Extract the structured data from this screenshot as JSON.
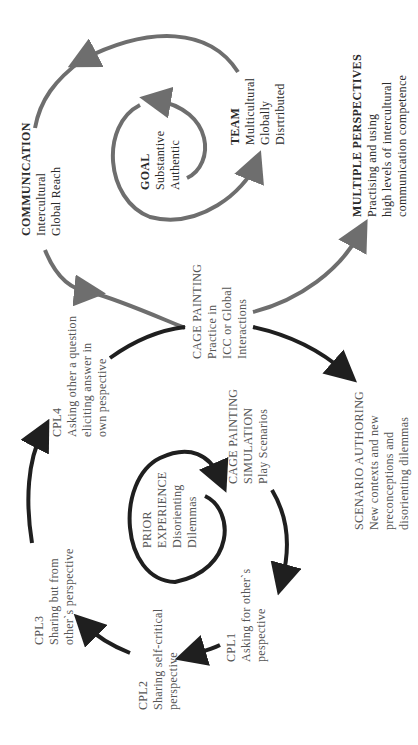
{
  "diagram": {
    "orientation": "rotated -90 degrees (text reads bottom-to-top)",
    "colors": {
      "outer_cycle": "#6e6e6e",
      "inner_cycle": "#1f1f1f",
      "background": "#ffffff",
      "text": "#2a2a2a"
    },
    "nodes": {
      "communication": {
        "title": "COMMUNICATION",
        "lines": [
          "Intercultural",
          "Global Reach"
        ]
      },
      "goal": {
        "title": "GOAL",
        "lines": [
          "Substantive",
          "Authentic"
        ]
      },
      "team": {
        "title": "TEAM",
        "lines": [
          "Multicultural",
          "Globally",
          "Disrtributed"
        ]
      },
      "multiple_perspectives": {
        "title": "MULTIPLE PERSPECTIVES",
        "lines": [
          "Practising and using",
          "high levels of intercultural",
          "communication competence"
        ]
      },
      "cage_painting": {
        "title": "CAGE PAINTING",
        "lines": [
          "Practice in",
          "ICC or Global",
          "Interactions"
        ]
      },
      "cpl4": {
        "title": "CPL4",
        "lines": [
          "Asking other a question",
          "eliciting answer in",
          "own pespective"
        ]
      },
      "cage_painting_simulation": {
        "title_lines": [
          "CAGE PAINTING",
          "SIMULATION"
        ],
        "lines": [
          "Play Scenarios"
        ]
      },
      "scenario_authoring": {
        "title": "SCENARIO AUTHORING",
        "lines": [
          "New contexts and new",
          "preconceptions and",
          "disorienting dilemmas"
        ]
      },
      "prior_experience": {
        "title_lines": [
          "PRIOR",
          "EXPERIENCE"
        ],
        "lines": [
          "Disorienting",
          "Dilemmas"
        ]
      },
      "cpl1": {
        "title": "CPL1",
        "lines": [
          "Asking for other`s",
          "pespective"
        ]
      },
      "cpl2": {
        "title": "CPL2",
        "lines": [
          "Sharing self-critical",
          "perspective"
        ]
      },
      "cpl3": {
        "title": "CPL3",
        "lines": [
          "Sharing but from",
          "other`s perspective"
        ]
      }
    }
  }
}
